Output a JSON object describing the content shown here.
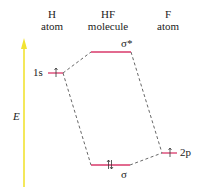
{
  "diagram": {
    "type": "molecular-orbital-energy-diagram",
    "columns": [
      {
        "line1": "H",
        "line2": "atom"
      },
      {
        "line1": "HF",
        "line2": "molecule"
      },
      {
        "line1": "F",
        "line2": "atom"
      }
    ],
    "energy_axis_label": "E",
    "levels": {
      "h_1s": {
        "label": "1s",
        "electrons": "↑"
      },
      "sigma_star": {
        "label": "σ*",
        "electrons": ""
      },
      "sigma": {
        "label": "σ",
        "electrons": "↑↓"
      },
      "f_2p": {
        "label": "2p",
        "electrons": "↑"
      }
    },
    "colors": {
      "level_line": "#d9386a",
      "energy_arrow": "#f2e332",
      "dashed_connector": "#555555"
    }
  }
}
